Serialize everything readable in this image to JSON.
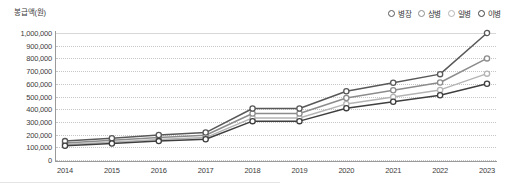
{
  "chart_data": {
    "type": "line",
    "title": "",
    "ylabel": "봉급액(원)",
    "xlabel": "",
    "categories": [
      "2014",
      "2015",
      "2016",
      "2017",
      "2018",
      "2019",
      "2020",
      "2021",
      "2022",
      "2023"
    ],
    "ylim": [
      0,
      1000000
    ],
    "ytick_labels": [
      "1,000,000",
      "900,000",
      "800,000",
      "700,000",
      "600,000",
      "500,000",
      "400,000",
      "300,000",
      "200,000",
      "100,000",
      "0"
    ],
    "ytick_values": [
      1000000,
      900000,
      800000,
      700000,
      600000,
      500000,
      400000,
      300000,
      200000,
      100000,
      0
    ],
    "grid": true,
    "legend_position": "top-right",
    "series": [
      {
        "name": "병장",
        "color": "#585858",
        "values": [
          149000,
          171400,
          197000,
          216000,
          405700,
          405700,
          540900,
          608500,
          676100,
          1000000
        ]
      },
      {
        "name": "상병",
        "color": "#8c8c8c",
        "values": [
          134600,
          154800,
          178000,
          195000,
          366200,
          366200,
          488200,
          549200,
          610200,
          800000
        ]
      },
      {
        "name": "일병",
        "color": "#b4b4b4",
        "values": [
          121700,
          140000,
          161000,
          176400,
          331300,
          331300,
          441700,
          496900,
          552100,
          680000
        ]
      },
      {
        "name": "이병",
        "color": "#3f3f3f",
        "values": [
          112500,
          129400,
          148800,
          163000,
          306100,
          306100,
          408100,
          459100,
          510100,
          600000
        ]
      }
    ]
  },
  "legend": {
    "items": [
      {
        "label": "병장",
        "marker": "open-circle"
      },
      {
        "label": "상병",
        "marker": "open-circle"
      },
      {
        "label": "일병",
        "marker": "open-circle"
      },
      {
        "label": "이병",
        "marker": "open-circle"
      }
    ]
  }
}
